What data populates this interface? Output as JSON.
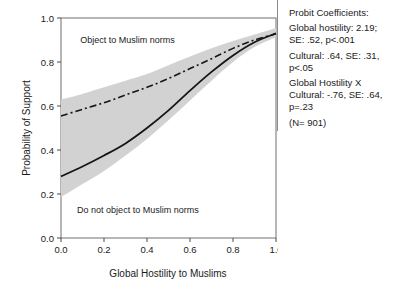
{
  "chart_data": {
    "type": "line",
    "title": "",
    "xlabel": "Global Hostility to Muslims",
    "ylabel": "Probability of Support",
    "xlim": [
      0.0,
      1.0
    ],
    "ylim": [
      0.0,
      1.0
    ],
    "xticks": [
      "0.0",
      "0.2",
      "0.4",
      "0.6",
      "0.8",
      "1.0"
    ],
    "xtick_values": [
      0.0,
      0.2,
      0.4,
      0.6,
      0.8,
      1.0
    ],
    "yticks": [
      "0.0",
      "0.2",
      "0.4",
      "0.6",
      "0.8",
      "1.0"
    ],
    "ytick_values": [
      0.0,
      0.2,
      0.4,
      0.6,
      0.8,
      1.0
    ],
    "grid": false,
    "legend": "none",
    "x": [
      0.0,
      0.1,
      0.2,
      0.3,
      0.4,
      0.5,
      0.6,
      0.7,
      0.8,
      0.9,
      1.0
    ],
    "series": [
      {
        "name": "Do not object to Muslim norms",
        "style": "solid",
        "color": "#151515",
        "values": [
          0.28,
          0.325,
          0.375,
          0.43,
          0.5,
          0.58,
          0.67,
          0.755,
          0.83,
          0.89,
          0.93
        ]
      },
      {
        "name": "Object to Muslim norms",
        "style": "dash-dot",
        "color": "#151515",
        "values": [
          0.555,
          0.585,
          0.615,
          0.65,
          0.685,
          0.725,
          0.77,
          0.815,
          0.862,
          0.9,
          0.928
        ]
      }
    ],
    "band": {
      "name": "confidence-band",
      "color": "#d2d2d2",
      "upper": [
        0.63,
        0.655,
        0.685,
        0.715,
        0.745,
        0.785,
        0.825,
        0.862,
        0.895,
        0.925,
        0.955
      ],
      "lower": [
        0.185,
        0.245,
        0.305,
        0.375,
        0.45,
        0.535,
        0.625,
        0.715,
        0.8,
        0.868,
        0.912
      ]
    },
    "annotations": [
      {
        "name": "upper-curve-label",
        "text": "Object to Muslim norms",
        "x": 0.09,
        "y": 0.885
      },
      {
        "name": "lower-curve-label",
        "text": "Do not object to Muslim norms",
        "x": 0.075,
        "y": 0.115
      }
    ]
  },
  "coefficients": {
    "heading": "Probit Coefficients:",
    "entries": [
      "Global hostility: 2.19;\nSE: .52, p<.001",
      "Cultural: .64, SE: .31,\np<.05",
      "Global Hostility X\nCultural: -.76, SE: .64,\np=.23",
      "(N= 901)"
    ]
  }
}
